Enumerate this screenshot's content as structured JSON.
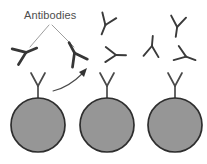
{
  "figure": {
    "background_color": "#ffffff",
    "width": 207,
    "height": 164
  },
  "labels": {
    "antibodies": "Antibodies"
  },
  "colors": {
    "cell_fill": "#969696",
    "cell_outline": "#2e2e2e",
    "antibody_stroke": "#3a3a3a",
    "leader_line": "#8d8d8d",
    "arrow": "#4a4a4a",
    "text": "#4d4d4d"
  },
  "free_antibodies": [
    {
      "id": "antibody-1",
      "cx": 27,
      "cy": 50,
      "rotation": 248,
      "scale": 1.05,
      "group": "left"
    },
    {
      "id": "antibody-2",
      "cx": 74,
      "cy": 50,
      "rotation": 152,
      "scale": 1.05,
      "group": "left"
    },
    {
      "id": "antibody-3",
      "cx": 106,
      "cy": 22,
      "rotation": 22,
      "scale": 1.0,
      "group": "middle-upper"
    },
    {
      "id": "antibody-4",
      "cx": 116,
      "cy": 55,
      "rotation": 272,
      "scale": 1.0,
      "group": "middle-lower"
    },
    {
      "id": "antibody-5",
      "cx": 152,
      "cy": 45,
      "rotation": 185,
      "scale": 1.0,
      "group": "right-left"
    },
    {
      "id": "antibody-6",
      "cx": 176,
      "cy": 25,
      "rotation": 8,
      "scale": 1.0,
      "group": "right-upper"
    },
    {
      "id": "antibody-7",
      "cx": 186,
      "cy": 57,
      "rotation": 290,
      "scale": 1.0,
      "group": "right-lower"
    }
  ],
  "leader_lines": [
    {
      "id": "leader-left",
      "points": "48,24 30,46"
    },
    {
      "id": "leader-right",
      "points": "52,24 74,48"
    }
  ],
  "cells": [
    {
      "id": "cell-1",
      "cx": 38,
      "cy": 125,
      "r": 27,
      "receptor_base_y": 99,
      "receptor_top_y": 72
    },
    {
      "id": "cell-2",
      "cx": 107,
      "cy": 125,
      "r": 27,
      "receptor_base_y": 99,
      "receptor_top_y": 72
    },
    {
      "id": "cell-3",
      "cx": 175,
      "cy": 125,
      "r": 27,
      "receptor_base_y": 99,
      "receptor_top_y": 72
    }
  ],
  "release_arrow": {
    "id": "release-arrow",
    "path": "M 53,90 C 62,88 74,82 84,73",
    "tip_x": 86,
    "tip_y": 70,
    "direction": "up-right"
  }
}
